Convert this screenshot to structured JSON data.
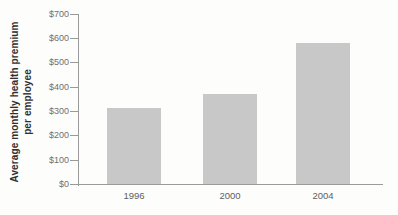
{
  "figure": {
    "background_color": "#fdfdfc"
  },
  "chart_data": {
    "type": "bar",
    "title": "",
    "xlabel": "",
    "ylabel": "Average monthly health premium per employee",
    "ylabel_line1": "Average monthly health premium",
    "ylabel_line2": "per employee",
    "categories": [
      "1996",
      "2000",
      "2004"
    ],
    "values": [
      310,
      370,
      580
    ],
    "ylim": [
      0,
      700
    ],
    "ytick_values": [
      0,
      100,
      200,
      300,
      400,
      500,
      600,
      700
    ],
    "ytick_labels": [
      "$0",
      "$100",
      "$200",
      "$300",
      "$400",
      "$500",
      "$600",
      "$700"
    ],
    "grid": false,
    "legend": null,
    "colors": {
      "bar_fill": "#c8c8c8",
      "axis_line": "#9a9a9a",
      "tick_label": "#6f6f6f",
      "category_label": "#606060",
      "ylabel_text": "#303030"
    }
  }
}
